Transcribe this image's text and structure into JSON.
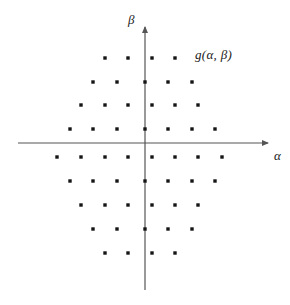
{
  "chart_data": {
    "type": "scatter",
    "title": "",
    "subtitle": "",
    "xlabel": "α",
    "ylabel": "β",
    "annotation": "g(α, β)",
    "grid": false,
    "legend": null,
    "axis_style": "arrowed-cartesian-axes-through-origin",
    "xlim": [
      -5.5,
      5.5
    ],
    "ylim": [
      -4.8,
      4.8
    ],
    "x_step": 1,
    "y_step": 1,
    "marker": {
      "shape": "square",
      "size_px": 3.4,
      "color": "#141414"
    },
    "axis_color": "#555555",
    "rows": [
      {
        "beta": 4,
        "offset": "half",
        "count": 4,
        "alpha": [
          -1.5,
          -0.5,
          0.5,
          1.5
        ]
      },
      {
        "beta": 3,
        "offset": "none",
        "count": 5,
        "alpha": [
          -2,
          -1,
          0,
          1,
          2
        ]
      },
      {
        "beta": 2,
        "offset": "half",
        "count": 6,
        "alpha": [
          -2.5,
          -1.5,
          -0.5,
          0.5,
          1.5,
          2.5
        ]
      },
      {
        "beta": 1,
        "offset": "none",
        "count": 7,
        "alpha": [
          -3,
          -2,
          -1,
          0,
          1,
          2,
          3
        ]
      },
      {
        "beta": -1,
        "offset": "half",
        "count": 8,
        "alpha": [
          -3.5,
          -2.5,
          -1.5,
          -0.5,
          0.5,
          1.5,
          2.5,
          3.5
        ]
      },
      {
        "beta": -2,
        "offset": "none",
        "count": 7,
        "alpha": [
          -3,
          -2,
          -1,
          0,
          1,
          2,
          3
        ]
      },
      {
        "beta": -3,
        "offset": "half",
        "count": 6,
        "alpha": [
          -2.5,
          -1.5,
          -0.5,
          0.5,
          1.5,
          2.5
        ]
      },
      {
        "beta": -4,
        "offset": "none",
        "count": 5,
        "alpha": [
          -2,
          -1,
          0,
          1,
          2
        ]
      },
      {
        "beta": -5,
        "offset": "half",
        "count": 4,
        "alpha": [
          -1.5,
          -0.5,
          0.5,
          1.5
        ]
      }
    ],
    "points_px": [
      [
        105,
        58
      ],
      [
        128,
        58
      ],
      [
        152,
        58
      ],
      [
        175,
        58
      ],
      [
        93,
        82
      ],
      [
        117,
        82
      ],
      [
        145,
        82
      ],
      [
        168,
        82
      ],
      [
        192,
        82
      ],
      [
        81,
        105
      ],
      [
        105,
        105
      ],
      [
        128,
        105
      ],
      [
        152,
        105
      ],
      [
        175,
        105
      ],
      [
        198,
        105
      ],
      [
        70,
        129
      ],
      [
        93,
        129
      ],
      [
        117,
        129
      ],
      [
        145,
        129
      ],
      [
        168,
        129
      ],
      [
        192,
        129
      ],
      [
        215,
        129
      ],
      [
        57,
        157
      ],
      [
        81,
        157
      ],
      [
        105,
        157
      ],
      [
        128,
        157
      ],
      [
        152,
        157
      ],
      [
        175,
        157
      ],
      [
        198,
        157
      ],
      [
        222,
        157
      ],
      [
        70,
        181
      ],
      [
        93,
        181
      ],
      [
        117,
        181
      ],
      [
        145,
        181
      ],
      [
        168,
        181
      ],
      [
        192,
        181
      ],
      [
        215,
        181
      ],
      [
        81,
        205
      ],
      [
        105,
        205
      ],
      [
        128,
        205
      ],
      [
        152,
        205
      ],
      [
        175,
        205
      ],
      [
        198,
        205
      ],
      [
        93,
        229
      ],
      [
        117,
        229
      ],
      [
        145,
        229
      ],
      [
        168,
        229
      ],
      [
        192,
        229
      ],
      [
        105,
        253
      ],
      [
        128,
        253
      ],
      [
        152,
        253
      ],
      [
        175,
        253
      ]
    ],
    "total_points": 52,
    "axes_px": {
      "origin": [
        145,
        143
      ],
      "x_axis": {
        "x1": 18,
        "y1": 143,
        "x2": 272,
        "y2": 143
      },
      "y_axis": {
        "x1": 145,
        "y1": 290,
        "x2": 145,
        "y2": 22
      }
    }
  }
}
